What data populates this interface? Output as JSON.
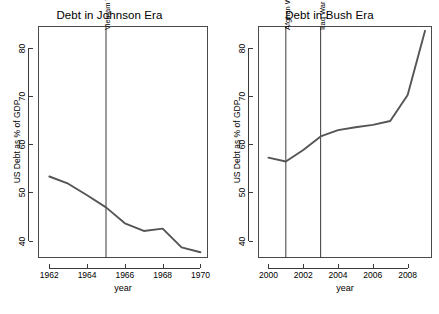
{
  "chart_data": [
    {
      "type": "line",
      "id": "johnson",
      "title": "Debt in Johnson Era",
      "xlabel": "year",
      "ylabel": "US Debt as % of GDP",
      "xlim": [
        1961.4,
        1970.4
      ],
      "ylim": [
        36.4,
        84.5
      ],
      "xticks": [
        1962,
        1964,
        1966,
        1968,
        1970
      ],
      "yticks": [
        40,
        50,
        60,
        70,
        80
      ],
      "grid": false,
      "legend": "none",
      "line_color": "#555555",
      "x": [
        1962,
        1963,
        1964,
        1965,
        1966,
        1967,
        1968,
        1969,
        1970
      ],
      "values": [
        53.3,
        51.8,
        49.4,
        46.9,
        43.6,
        42.0,
        42.5,
        38.6,
        37.6
      ],
      "series": [
        {
          "name": "US Debt as % of GDP",
          "values": [
            53.3,
            51.8,
            49.4,
            46.9,
            43.6,
            42.0,
            42.5,
            38.6,
            37.6
          ]
        }
      ],
      "annotations": [
        {
          "label": "Vietnam War",
          "x": 1965,
          "type": "vline"
        }
      ]
    },
    {
      "type": "line",
      "id": "bush",
      "title": "Debt in Bush Era",
      "xlabel": "year",
      "ylabel": "US Debt as % of GDP",
      "xlim": [
        1999.4,
        2009.4
      ],
      "ylim": [
        36.4,
        84.5
      ],
      "xticks": [
        2000,
        2002,
        2004,
        2006,
        2008
      ],
      "yticks": [
        40,
        50,
        60,
        70,
        80
      ],
      "grid": false,
      "legend": "none",
      "line_color": "#555555",
      "x": [
        2000,
        2001,
        2002,
        2003,
        2004,
        2005,
        2006,
        2007,
        2008,
        2009
      ],
      "values": [
        57.2,
        56.4,
        58.8,
        61.6,
        62.9,
        63.5,
        64.0,
        64.8,
        70.2,
        83.5
      ],
      "series": [
        {
          "name": "US Debt as % of GDP",
          "values": [
            57.2,
            56.4,
            58.8,
            61.6,
            62.9,
            63.5,
            64.0,
            64.8,
            70.2,
            83.5
          ]
        }
      ],
      "annotations": [
        {
          "label": "Afghan War",
          "x": 2001,
          "type": "vline"
        },
        {
          "label": "Iraq War",
          "x": 2003,
          "type": "vline"
        }
      ]
    }
  ],
  "figure": {
    "background": "#ffffff",
    "axis_color": "#3a3a3a",
    "line_color": "#555555"
  }
}
